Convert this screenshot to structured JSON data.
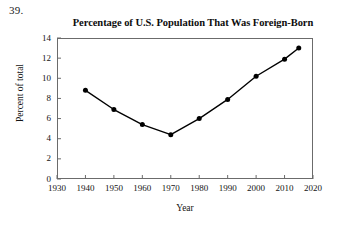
{
  "question_number": "39.",
  "chart_data": {
    "type": "line",
    "title": "Percentage of U.S. Population That Was Foreign-Born",
    "xlabel": "Year",
    "ylabel": "Percent of total",
    "x": [
      1940,
      1950,
      1960,
      1970,
      1980,
      1990,
      2000,
      2010,
      2015
    ],
    "values": [
      8.8,
      6.9,
      5.4,
      4.4,
      6.0,
      7.9,
      10.2,
      11.9,
      13.0
    ],
    "xlim": [
      1930,
      2020
    ],
    "ylim": [
      0,
      14
    ],
    "xticks": [
      1930,
      1940,
      1950,
      1960,
      1970,
      1980,
      1990,
      2000,
      2010,
      2020
    ],
    "yticks": [
      0,
      2,
      4,
      6,
      8,
      10,
      12,
      14
    ],
    "xtick_labels": [
      "1930",
      "1940",
      "1950",
      "1960",
      "1970",
      "1980",
      "1990",
      "2000",
      "2010",
      "2020"
    ],
    "ytick_labels": [
      "0",
      "2",
      "4",
      "6",
      "8",
      "10",
      "12",
      "14"
    ],
    "grid": false,
    "legend": null,
    "marker": "filled-circle",
    "line_color": "#000000",
    "marker_color": "#000000",
    "frame_color": "#6b6b6b"
  }
}
